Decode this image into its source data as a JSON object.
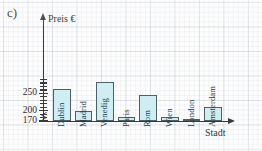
{
  "exercise": {
    "label": "c)"
  },
  "chart_data": {
    "type": "bar",
    "title": "",
    "xlabel": "Stadt",
    "ylabel": "Preis €",
    "categories": [
      "Dublin",
      "Madrid",
      "Venedig",
      "Paris",
      "Rom",
      "Wien",
      "London",
      "Amsterdam"
    ],
    "values": [
      265,
      199,
      285,
      182,
      245,
      183,
      175,
      212
    ],
    "ytick_labels": [
      "250",
      "200",
      "170"
    ],
    "ytick_values": [
      250,
      200,
      170
    ],
    "ylim": [
      170,
      295
    ],
    "axis_break": true,
    "grid": true,
    "legend": null,
    "bar_fill_color": "#ceeef4",
    "bar_outline_color": "#4d6066",
    "hollow_bars": [
      "London"
    ],
    "labels_inside_bars": true,
    "label_orientation": "vertical"
  },
  "axes": {
    "y_title": "Preis €",
    "x_title": "Stadt"
  },
  "ticks": [
    {
      "label": "250",
      "value": 250
    },
    {
      "label": "200",
      "value": 200
    },
    {
      "label": "170",
      "value": 170
    }
  ],
  "bars": [
    {
      "label": "Dublin",
      "value": 265
    },
    {
      "label": "Madrid",
      "value": 199
    },
    {
      "label": "Venedig",
      "value": 285
    },
    {
      "label": "Paris",
      "value": 182
    },
    {
      "label": "Rom",
      "value": 245
    },
    {
      "label": "Wien",
      "value": 183
    },
    {
      "label": "London",
      "value": 175
    },
    {
      "label": "Amsterdam",
      "value": 212
    }
  ]
}
